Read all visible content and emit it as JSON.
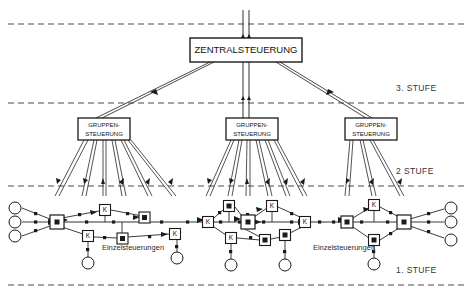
{
  "diagram": {
    "width": 472,
    "height": 297,
    "background": "#ffffff",
    "line_color": "#1a1a1a",
    "dashed_color": "#4a4a4a"
  },
  "central": {
    "label": "ZENTRALSTEUERUNG",
    "x": 190,
    "y": 38,
    "w": 112,
    "h": 24,
    "font_size": 9
  },
  "groups": [
    {
      "label_line1": "GRUPPEN-",
      "label_line2": "STEUERUNG",
      "x": 78,
      "y": 118,
      "w": 52,
      "h": 22,
      "font_size": 6
    },
    {
      "label_line1": "GRUPPEN-",
      "label_line2": "STEUERUNG",
      "x": 226,
      "y": 118,
      "w": 52,
      "h": 22,
      "font_size": 6
    },
    {
      "label_line1": "GRUPPEN-",
      "label_line2": "STEUERUNG",
      "x": 345,
      "y": 118,
      "w": 52,
      "h": 22,
      "font_size": 6
    }
  ],
  "stage_lines": [
    {
      "name": "top-boundary",
      "y": 24,
      "label": ""
    },
    {
      "name": "stage-3",
      "y": 103,
      "label": "3. STUFE",
      "label_x": 396,
      "label_y": 91
    },
    {
      "name": "stage-2",
      "y": 186,
      "label": "2 STUFE",
      "label_x": 396,
      "label_y": 174
    },
    {
      "name": "stage-1",
      "y": 285,
      "label": "1. STUFE",
      "label_x": 396,
      "label_y": 273
    }
  ],
  "annotations": [
    {
      "text": "Einzelsteuerungen",
      "x": 133,
      "y": 247
    },
    {
      "text": "Einzelsteuerungen",
      "x": 344,
      "y": 247
    }
  ],
  "node_legend": {
    "controller_box": "K",
    "junction_node": "filled-square-in-square",
    "terminal_node": "open-circle"
  },
  "clusters": [
    {
      "name": "left-cluster",
      "hub": {
        "x": 57,
        "y": 222,
        "type": "junction"
      },
      "nodes": [
        {
          "type": "k-box",
          "x": 105,
          "y": 210
        },
        {
          "type": "k-box",
          "x": 88,
          "y": 236
        },
        {
          "type": "k-box",
          "x": 175,
          "y": 234
        },
        {
          "type": "junction",
          "x": 145,
          "y": 218
        },
        {
          "type": "junction",
          "x": 122,
          "y": 238
        },
        {
          "type": "circle",
          "x": 15,
          "y": 208
        },
        {
          "type": "circle",
          "x": 15,
          "y": 222
        },
        {
          "type": "circle",
          "x": 15,
          "y": 236
        },
        {
          "type": "circle",
          "x": 88,
          "y": 263
        },
        {
          "type": "circle",
          "x": 177,
          "y": 258
        }
      ]
    },
    {
      "name": "middle-cluster",
      "hub": {
        "x": 248,
        "y": 222,
        "type": "junction"
      },
      "nodes": [
        {
          "type": "k-box",
          "x": 208,
          "y": 222
        },
        {
          "type": "k-box",
          "x": 229,
          "y": 206
        },
        {
          "type": "k-box",
          "x": 272,
          "y": 206
        },
        {
          "type": "k-box",
          "x": 231,
          "y": 238
        },
        {
          "type": "k-box",
          "x": 305,
          "y": 222
        },
        {
          "type": "junction",
          "x": 265,
          "y": 240
        },
        {
          "type": "junction",
          "x": 285,
          "y": 235
        },
        {
          "type": "circle",
          "x": 231,
          "y": 265
        },
        {
          "type": "circle",
          "x": 285,
          "y": 265
        }
      ]
    },
    {
      "name": "right-cluster",
      "hub": {
        "x": 404,
        "y": 222,
        "type": "junction"
      },
      "nodes": [
        {
          "type": "k-box",
          "x": 374,
          "y": 205
        },
        {
          "type": "junction",
          "x": 347,
          "y": 222
        },
        {
          "type": "junction",
          "x": 374,
          "y": 240
        },
        {
          "type": "circle",
          "x": 451,
          "y": 208
        },
        {
          "type": "circle",
          "x": 451,
          "y": 222
        },
        {
          "type": "circle",
          "x": 451,
          "y": 240
        },
        {
          "type": "circle",
          "x": 374,
          "y": 264
        }
      ]
    }
  ]
}
